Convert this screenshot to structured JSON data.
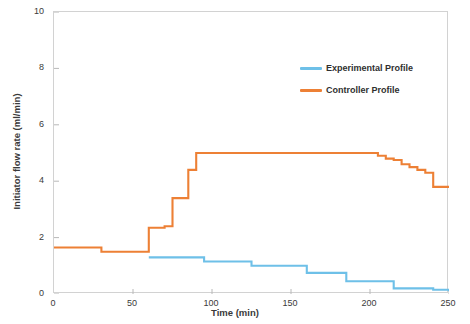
{
  "chart_data": {
    "type": "line",
    "title": "",
    "xlabel": "Time (min)",
    "ylabel": "Initiator flow rate (ml/min)",
    "xlim": [
      0,
      250
    ],
    "ylim": [
      0,
      10
    ],
    "xticks": [
      0,
      50,
      100,
      150,
      200,
      250
    ],
    "yticks": [
      0,
      2,
      4,
      6,
      8,
      10
    ],
    "grid": false,
    "legend_position": "upper right",
    "line_style": "step",
    "series": [
      {
        "name": "Experimental Profile",
        "color": "#6EC0E8",
        "x": [
          60,
          65,
          70,
          75,
          80,
          85,
          90,
          95,
          100,
          105,
          110,
          115,
          120,
          125,
          130,
          135,
          140,
          145,
          150,
          155,
          160,
          165,
          170,
          175,
          180,
          185,
          190,
          195,
          200,
          205,
          210,
          215,
          220,
          225,
          230,
          235,
          240,
          245,
          250
        ],
        "values": [
          1.3,
          1.3,
          1.3,
          1.3,
          1.3,
          1.3,
          1.3,
          1.15,
          1.15,
          1.15,
          1.15,
          1.15,
          1.15,
          1.0,
          1.0,
          1.0,
          1.0,
          1.0,
          1.0,
          1.0,
          0.75,
          0.75,
          0.75,
          0.75,
          0.75,
          0.45,
          0.45,
          0.45,
          0.45,
          0.45,
          0.45,
          0.2,
          0.2,
          0.2,
          0.2,
          0.2,
          0.15,
          0.15,
          0.1
        ]
      },
      {
        "name": "Controller Profile",
        "color": "#ED8035",
        "x": [
          0,
          5,
          10,
          15,
          20,
          25,
          30,
          35,
          40,
          45,
          50,
          55,
          60,
          65,
          70,
          75,
          80,
          85,
          90,
          95,
          100,
          110,
          120,
          130,
          140,
          150,
          160,
          170,
          180,
          190,
          200,
          205,
          210,
          215,
          220,
          225,
          230,
          235,
          240,
          245,
          250
        ],
        "values": [
          1.65,
          1.65,
          1.65,
          1.65,
          1.65,
          1.65,
          1.5,
          1.5,
          1.5,
          1.5,
          1.5,
          1.5,
          2.35,
          2.35,
          2.4,
          3.4,
          3.4,
          4.4,
          5.0,
          5.0,
          5.0,
          5.0,
          5.0,
          5.0,
          5.0,
          5.0,
          5.0,
          5.0,
          5.0,
          5.0,
          5.0,
          4.9,
          4.8,
          4.75,
          4.6,
          4.5,
          4.4,
          4.3,
          3.8,
          3.8,
          3.8
        ]
      }
    ]
  },
  "legend": {
    "entries": [
      {
        "label": "Experimental Profile",
        "color": "#6EC0E8"
      },
      {
        "label": "Controller Profile",
        "color": "#ED8035"
      }
    ]
  },
  "axes": {
    "x_title": "Time (min)",
    "y_title": "Initiator flow rate (ml/min)",
    "x_tick_labels": [
      "0",
      "50",
      "100",
      "150",
      "200",
      "250"
    ],
    "y_tick_labels": [
      "0",
      "2",
      "4",
      "6",
      "8",
      "10"
    ]
  },
  "colors": {
    "experimental": "#6EC0E8",
    "controller": "#ED8035",
    "frame": "#d2d2d2",
    "text": "#3a3a3a"
  }
}
